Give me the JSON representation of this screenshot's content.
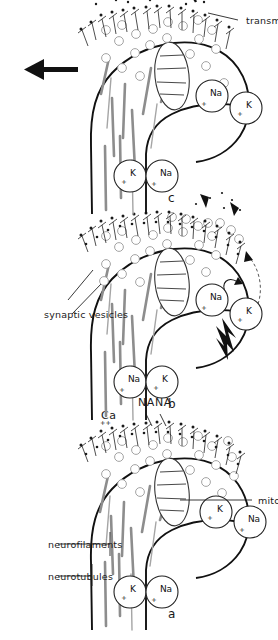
{
  "figure": {
    "kind": "scientific-diagram",
    "orientation_note": "rotated",
    "panels": [
      {
        "id": "panel-a",
        "letter": "a",
        "stage": "resting",
        "labels": [
          {
            "name": "neurotubules",
            "text": "neurotubules"
          },
          {
            "name": "neurofilaments",
            "text": "neurofilaments"
          },
          {
            "name": "mitochondrium",
            "text": "mitochondrium"
          },
          {
            "name": "calcium",
            "text": "Ca"
          },
          {
            "name": "calcium-charge",
            "text": "++"
          },
          {
            "name": "nana",
            "text": "NANA"
          }
        ],
        "ions": [
          {
            "element": "K",
            "charge": "+"
          },
          {
            "element": "Na",
            "charge": "+"
          },
          {
            "element": "K",
            "charge": "+"
          },
          {
            "element": "Na",
            "charge": "+"
          }
        ]
      },
      {
        "id": "panel-b",
        "letter": "b",
        "stage": "depolarization",
        "labels": [
          {
            "name": "synaptic-vesicles",
            "text": "synaptic vesicles"
          }
        ],
        "ions": [
          {
            "element": "Na",
            "charge": "+"
          },
          {
            "element": "K",
            "charge": "+"
          },
          {
            "element": "Na",
            "charge": "+"
          },
          {
            "element": "K",
            "charge": "+"
          }
        ]
      },
      {
        "id": "panel-c",
        "letter": "c",
        "stage": "transmitter release",
        "labels": [
          {
            "name": "transmitter",
            "text": "transmitter"
          },
          {
            "name": "transmission",
            "text": "transmission"
          }
        ],
        "ions": [
          {
            "element": "K",
            "charge": "+"
          },
          {
            "element": "Na",
            "charge": "+"
          },
          {
            "element": "Na",
            "charge": "+"
          },
          {
            "element": "K",
            "charge": "+"
          }
        ]
      }
    ],
    "colors": {
      "ink": "#1a1a1a",
      "fiber": "#8d8d8d",
      "vesicle_outline": "#9a9a9a",
      "background": "#ffffff"
    }
  }
}
